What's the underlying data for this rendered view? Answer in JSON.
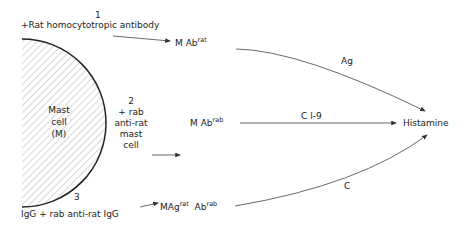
{
  "diagram": {
    "cell": {
      "line1": "Mast",
      "line2": "cell",
      "line3": "(M)"
    },
    "path1": {
      "number": "1",
      "reagent": "+Rat homocytotropic antibody",
      "product_base": "M Ab",
      "product_sup": "rat",
      "trigger": "Ag"
    },
    "path2": {
      "number": "2",
      "reagent_line1": "+ rab",
      "reagent_line2": "anti-rat",
      "reagent_line3": "mast",
      "reagent_line4": "cell",
      "product_base": "M Ab",
      "product_sup": "rab",
      "trigger": "C l-9"
    },
    "path3": {
      "number": "3",
      "reagent": "IgG + rab anti-rat IgG",
      "product_base1": "MAg",
      "product_sup1": "rat",
      "product_base2": "Ab",
      "product_sup2": "rab",
      "trigger": "C"
    },
    "result": "Histamine"
  }
}
